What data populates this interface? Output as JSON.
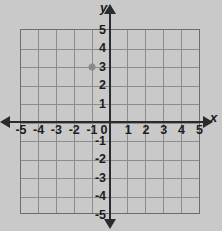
{
  "chart_data": {
    "type": "scatter",
    "title": "",
    "xlabel": "x",
    "ylabel": "y",
    "xlim": [
      -5,
      5
    ],
    "ylim": [
      -5,
      5
    ],
    "grid": true,
    "legend": "none",
    "x_ticks": [
      "-5",
      "-4",
      "-3",
      "-2",
      "-1",
      "0",
      "1",
      "2",
      "3",
      "4",
      "5"
    ],
    "y_ticks": [
      "5",
      "4",
      "3",
      "2",
      "1",
      "0",
      "-1",
      "-2",
      "-3",
      "-4",
      "-5"
    ],
    "origin_label": "0",
    "points": [
      {
        "label": "plotted-point",
        "x": -1,
        "y": 3,
        "color": "#8a8a8a"
      }
    ]
  },
  "colors": {
    "background": "#c9c9c9",
    "grid_line": "#8c8c8c",
    "grid_border": "#6d6d6d",
    "axis": "#2b2b2b",
    "label_text": "#1c1c1c",
    "point": "#8a8a8a"
  },
  "axis_labels": {
    "x_name": "x",
    "y_name": "y"
  }
}
